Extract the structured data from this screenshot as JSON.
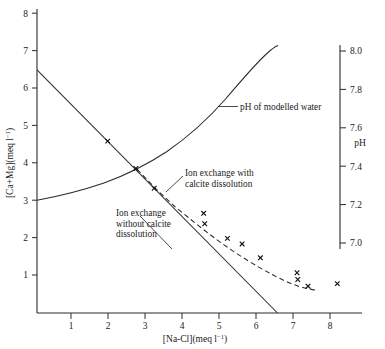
{
  "figure": {
    "title": "",
    "background": "#ffffff",
    "ink_color": "#2b2b2b"
  },
  "axes": {
    "left": {
      "label_parts": {
        "main": "[Ca+Mg](meq l",
        "exponent": "−1",
        "tail": ")"
      },
      "label_full": "[Ca+Mg](meq l⁻¹)",
      "ticks": [
        "1",
        "2",
        "3",
        "4",
        "5",
        "6",
        "7",
        "8"
      ],
      "min": 0,
      "max": 8.35
    },
    "bottom": {
      "label_parts": {
        "main": "[Na-Cl](meq l",
        "exponent": "−1",
        "tail": ")"
      },
      "label_full": "[Na-Cl](meq l⁻¹)",
      "ticks": [
        "1",
        "2",
        "3",
        "4",
        "5",
        "6",
        "7",
        "8"
      ],
      "min": 0,
      "max": 8.7
    },
    "right": {
      "label": "pH",
      "ticks": [
        "7.0",
        "7.2",
        "7.4",
        "7.6",
        "7.8",
        "8.0"
      ],
      "min": 6.93,
      "max": 8.0
    }
  },
  "annotations": [
    {
      "id": "ph-curve-label",
      "lines": [
        "pH of modelled water"
      ]
    },
    {
      "id": "ion-exchange-with-calcite-label",
      "lines": [
        "Ion exchange with",
        "calcite dissolution"
      ]
    },
    {
      "id": "ion-exchange-without-calcite-label",
      "lines": [
        "Ion exchange",
        "without calcite",
        "dissolution"
      ]
    }
  ],
  "chart_data": {
    "type": "line",
    "title": "",
    "xlabel": "[Na-Cl](meq l⁻¹)",
    "ylabel": "[Ca+Mg](meq l⁻¹)",
    "y2label": "pH",
    "xlim": [
      0,
      8.7
    ],
    "ylim": [
      0,
      8.35
    ],
    "y2lim": [
      6.93,
      8.0
    ],
    "grid": false,
    "legend": "annotations-inline",
    "series": [
      {
        "name": "Ion exchange without calcite dissolution",
        "style": "solid",
        "axis": "left",
        "x": [
          0.0,
          0.5,
          1.0,
          1.5,
          2.0,
          2.5,
          3.0,
          3.5,
          4.0,
          4.5,
          5.0,
          5.5,
          6.0,
          6.5
        ],
        "y": [
          6.5,
          6.0,
          5.5,
          5.0,
          4.5,
          4.0,
          3.5,
          3.0,
          2.5,
          2.0,
          1.5,
          1.0,
          0.5,
          0.0
        ]
      },
      {
        "name": "Ion exchange with calcite dissolution",
        "style": "dashed",
        "axis": "left",
        "x": [
          2.7,
          3.2,
          3.7,
          4.2,
          4.7,
          5.2,
          5.7,
          6.2,
          6.7,
          7.2,
          7.6
        ],
        "y": [
          3.85,
          3.35,
          2.9,
          2.5,
          2.15,
          1.85,
          1.55,
          1.3,
          1.05,
          0.8,
          0.62
        ]
      },
      {
        "name": "pH of modelled water",
        "style": "solid",
        "axis": "right",
        "x": [
          0.0,
          0.8,
          1.6,
          2.4,
          3.2,
          4.0,
          4.8,
          5.4,
          5.9,
          6.2,
          6.4,
          6.5
        ],
        "y": [
          7.2,
          7.26,
          7.33,
          7.41,
          7.5,
          7.6,
          7.72,
          7.82,
          7.9,
          7.95,
          7.98,
          8.0
        ]
      }
    ],
    "scatter": {
      "name": "Measured samples",
      "marker": "x",
      "axis": "left",
      "points": [
        {
          "x": 1.93,
          "y": 4.58
        },
        {
          "x": 2.7,
          "y": 3.85
        },
        {
          "x": 3.2,
          "y": 3.32
        },
        {
          "x": 4.55,
          "y": 2.65
        },
        {
          "x": 4.58,
          "y": 2.37
        },
        {
          "x": 5.2,
          "y": 1.98
        },
        {
          "x": 5.6,
          "y": 1.83
        },
        {
          "x": 6.1,
          "y": 1.46
        },
        {
          "x": 7.1,
          "y": 1.06
        },
        {
          "x": 7.12,
          "y": 0.88
        },
        {
          "x": 7.4,
          "y": 0.7
        },
        {
          "x": 8.2,
          "y": 0.77
        }
      ]
    }
  }
}
